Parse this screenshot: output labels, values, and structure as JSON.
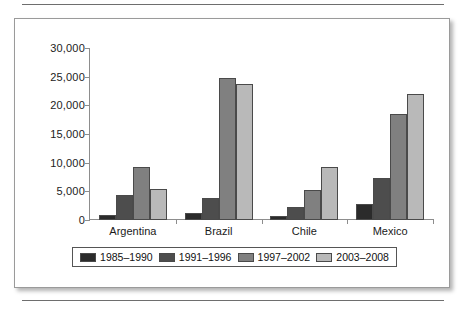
{
  "figure": {
    "frame_label": "bar-chart-figure"
  },
  "chart_data": {
    "type": "bar",
    "title": "",
    "subtitle": "",
    "xlabel": "",
    "ylabel": "",
    "categories": [
      "Argentina",
      "Brazil",
      "Chile",
      "Mexico"
    ],
    "series": [
      {
        "name": "1985–1990",
        "color": "#2b2b2b",
        "values": [
          900,
          1300,
          700,
          2800
        ]
      },
      {
        "name": "1991–1996",
        "color": "#4d4d4d",
        "values": [
          4400,
          3800,
          2300,
          7300
        ]
      },
      {
        "name": "1997–2002",
        "color": "#808080",
        "values": [
          9300,
          24800,
          5200,
          18500
        ]
      },
      {
        "name": "2003–2008",
        "color": "#b9b9b9",
        "values": [
          5400,
          23800,
          9300,
          22000
        ]
      }
    ],
    "ylim": [
      0,
      30000
    ],
    "ytick_values": [
      0,
      5000,
      10000,
      15000,
      20000,
      25000,
      30000
    ],
    "ytick_labels": [
      "0",
      "5,000",
      "10,000",
      "15,000",
      "20,000",
      "25,000",
      "30,000"
    ],
    "grid": false,
    "legend_position": "bottom"
  },
  "legend": {
    "items": [
      {
        "label": "1985–1990"
      },
      {
        "label": "1991–1996"
      },
      {
        "label": "1997–2002"
      },
      {
        "label": "2003–2008"
      }
    ]
  }
}
